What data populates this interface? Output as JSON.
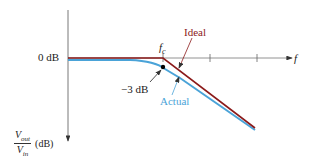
{
  "diagram": {
    "y_axis": {
      "label_num": "V",
      "label_num_sub": "out",
      "label_den": "V",
      "label_den_sub": "in",
      "unit": "(dB)"
    },
    "x_axis": {
      "label": "f"
    },
    "zero_db_label": "0 dB",
    "cutoff_label": "f",
    "cutoff_sub": "c",
    "minus3db_label": "−3 dB",
    "ideal_label": "Ideal",
    "actual_label": "Actual",
    "colors": {
      "ideal": "#8b1a1a",
      "actual": "#4aa3d8",
      "axis": "#555555",
      "text": "#222222"
    }
  }
}
